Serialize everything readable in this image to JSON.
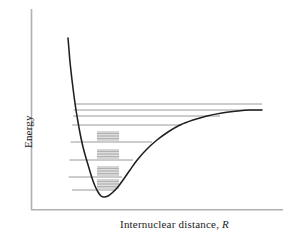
{
  "figure": {
    "axes": {
      "y_label": "Energy",
      "x_label_text": "Internuclear distance,",
      "x_label_symbol": "R"
    },
    "colors": {
      "axis": "#b0b0b0",
      "curve": "#1f1f1f",
      "level_line": "#8f8f8f",
      "rotational_line": "#9a9a9a",
      "background": "#ffffff"
    }
  },
  "chart_data": {
    "type": "line",
    "title": "",
    "xlabel": "Internuclear distance, R",
    "ylabel": "Energy",
    "grid": false,
    "legend_position": "none",
    "axis_ticks": {
      "x": [],
      "y": []
    },
    "series": [
      {
        "name": "Potential energy curve V(R)",
        "x": [
          68,
          69,
          70,
          72,
          74,
          76,
          78,
          80,
          83,
          86,
          89,
          92,
          95,
          98,
          101,
          104,
          108,
          112,
          117,
          123,
          130,
          138,
          147,
          157,
          168,
          180,
          193,
          207,
          222,
          238,
          250,
          262
        ],
        "y": [
          38,
          50,
          62,
          80,
          96,
          110,
          122,
          133,
          147,
          158,
          168,
          178,
          186,
          192,
          196,
          197,
          196,
          193,
          188,
          180,
          170,
          159,
          149,
          140,
          132,
          125,
          120,
          116,
          113,
          111,
          110,
          110
        ]
      }
    ],
    "dissociation_asymptote": 110,
    "equilibrium_point": {
      "x": 104,
      "y": 197
    },
    "vibrational_levels": [
      {
        "index": 7,
        "y": 104,
        "x_left": 74.2,
        "x_right": 262,
        "rotational_sublevels": 0
      },
      {
        "index": 6,
        "y": 110,
        "x_left": 73.6,
        "x_right": 262,
        "rotational_sublevels": 0
      },
      {
        "index": 5,
        "y": 116,
        "x_left": 73.0,
        "x_right": 220,
        "rotational_sublevels": 0
      },
      {
        "index": 4,
        "y": 125,
        "x_left": 72.2,
        "x_right": 182,
        "rotational_sublevels": 0
      },
      {
        "index": 3,
        "y": 142,
        "x_left": 70.6,
        "x_right": 152,
        "rotational_sublevels": 6
      },
      {
        "index": 2,
        "y": 160,
        "x_left": 69.4,
        "x_right": 133,
        "rotational_sublevels": 6
      },
      {
        "index": 1,
        "y": 177,
        "x_left": 68.6,
        "x_right": 122,
        "rotational_sublevels": 6
      },
      {
        "index": 0,
        "y": 190,
        "x_left": 72.0,
        "x_right": 116,
        "rotational_sublevels": 6
      }
    ],
    "rotational_clusters": [
      {
        "parent_level": 3,
        "x_left": 97,
        "x_right": 119,
        "y_values": [
          132.0,
          133.6,
          135.2,
          136.8,
          138.4,
          140.0
        ]
      },
      {
        "parent_level": 2,
        "x_left": 97,
        "x_right": 119,
        "y_values": [
          150.0,
          151.6,
          153.2,
          154.8,
          156.4,
          158.0
        ]
      },
      {
        "parent_level": 1,
        "x_left": 97,
        "x_right": 119,
        "y_values": [
          167.0,
          168.6,
          170.2,
          171.8,
          173.4,
          175.0
        ]
      },
      {
        "parent_level": 0,
        "x_left": 97,
        "x_right": 119,
        "y_values": [
          180.0,
          181.6,
          183.2,
          184.8,
          186.4,
          188.0
        ]
      }
    ]
  }
}
